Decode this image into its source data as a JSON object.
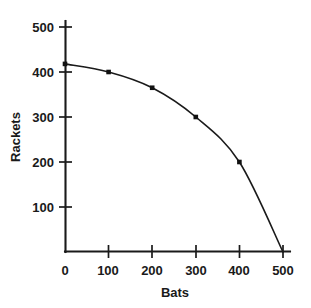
{
  "chart_data": {
    "type": "line",
    "title": "",
    "xlabel": "Bats",
    "ylabel": "Rackets",
    "xlim": [
      0,
      500
    ],
    "ylim": [
      0,
      500
    ],
    "grid": false,
    "legend": null,
    "x": [
      0,
      100,
      200,
      300,
      400,
      500
    ],
    "values": [
      418,
      400,
      365,
      300,
      200,
      0
    ],
    "series": [
      {
        "name": "Production possibility frontier",
        "values": [
          418,
          400,
          365,
          300,
          200,
          0
        ]
      }
    ],
    "xticks": [
      "0",
      "100",
      "200",
      "300",
      "400",
      "500"
    ],
    "xtick_values": [
      0,
      100,
      200,
      300,
      400,
      500
    ],
    "yticks": [
      "100",
      "200",
      "300",
      "400",
      "500"
    ],
    "ytick_values": [
      100,
      200,
      300,
      400,
      500
    ],
    "marker": "square",
    "marker_color": "#111111",
    "line_color": "#1a1a1a",
    "background_color": "#ffffff"
  },
  "axes": {
    "x_title": "Bats",
    "y_title": "Rackets",
    "x_tick_labels": [
      {
        "text": "0",
        "value": 0
      },
      {
        "text": "100",
        "value": 100
      },
      {
        "text": "200",
        "value": 200
      },
      {
        "text": "300",
        "value": 300
      },
      {
        "text": "400",
        "value": 400
      },
      {
        "text": "500",
        "value": 500
      }
    ],
    "y_tick_labels": [
      {
        "text": "100",
        "value": 100
      },
      {
        "text": "200",
        "value": 200
      },
      {
        "text": "300",
        "value": 300
      },
      {
        "text": "400",
        "value": 400
      },
      {
        "text": "500",
        "value": 500
      }
    ]
  }
}
